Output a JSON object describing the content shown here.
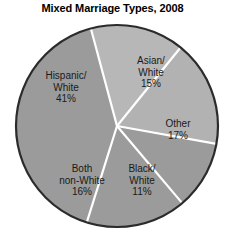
{
  "chart_data": {
    "type": "pie",
    "title": "Mixed Marriage Types, 2008",
    "xlabel": "",
    "ylabel": "",
    "legend": "none",
    "grid": false,
    "categories": [
      "Hispanic/White",
      "Asian/White",
      "Other",
      "Black/White",
      "Both non-White"
    ],
    "values": [
      41,
      15,
      17,
      11,
      16
    ],
    "unit": "percent",
    "slices": [
      {
        "name": "Hispanic/White",
        "value": 41,
        "label_lines": [
          "Hispanic/",
          "White",
          "41%"
        ],
        "percent_text": "41%",
        "color": "#9b9b9b"
      },
      {
        "name": "Asian/White",
        "value": 15,
        "label_lines": [
          "Asian/",
          "White",
          "15%"
        ],
        "percent_text": "15%",
        "color": "#b7b7b7"
      },
      {
        "name": "Other",
        "value": 17,
        "label_lines": [
          "Other",
          "17%"
        ],
        "percent_text": "17%",
        "color": "#b2b2b2"
      },
      {
        "name": "Black/White",
        "value": 11,
        "label_lines": [
          "Black/",
          "White",
          "11%"
        ],
        "percent_text": "11%",
        "color": "#9b9b9b"
      },
      {
        "name": "Both non-White",
        "value": 16,
        "label_lines": [
          "Both",
          "non-White",
          "16%"
        ],
        "percent_text": "16%",
        "color": "#9b9b9b"
      }
    ],
    "colors": {
      "outline": "#2b2b2b",
      "divider": "#ffffff",
      "background": "#ffffff",
      "text": "#1a1a1a"
    }
  }
}
